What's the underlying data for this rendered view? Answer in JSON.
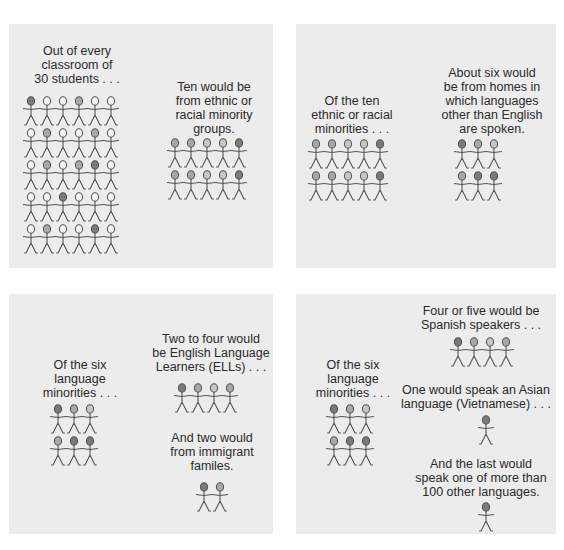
{
  "colors": {
    "panel_bg": "#ececec",
    "page_bg": "#ffffff",
    "text": "#2a2a2a",
    "head_dark": "#7a7a7a",
    "head_medium": "#a8a8a8",
    "head_light": "#c6c6c6",
    "head_white": "#f4f4f4"
  },
  "panels": [
    {
      "id": "classroom",
      "captions": [
        "Out of every\nclassroom of\n30 students . . .",
        "Ten would be\nfrom ethnic or\nracial minority\ngroups."
      ],
      "groups": [
        {
          "label": "30 students",
          "cols": 6,
          "heads": [
            "d",
            "w",
            "w",
            "m",
            "w",
            "w",
            "w",
            "m",
            "w",
            "w",
            "m",
            "w",
            "w",
            "m",
            "w",
            "m",
            "d",
            "w",
            "w",
            "w",
            "d",
            "w",
            "w",
            "w",
            "w",
            "m",
            "w",
            "w",
            "d",
            "w"
          ]
        },
        {
          "label": "10 ethnic or racial minorities",
          "cols": 5,
          "heads": [
            "m",
            "m",
            "l",
            "l",
            "d",
            "m",
            "m",
            "l",
            "l",
            "d"
          ]
        }
      ]
    },
    {
      "id": "ethnic-minorities",
      "captions": [
        "Of the ten\nethnic or racial\nminorities . . .",
        "About six would\nbe from homes in\nwhich languages\nother than English\nare spoken."
      ],
      "groups": [
        {
          "label": "10 ethnic or racial minorities",
          "cols": 5,
          "heads": [
            "m",
            "m",
            "l",
            "l",
            "d",
            "m",
            "m",
            "l",
            "l",
            "d"
          ]
        },
        {
          "label": "6 language minorities",
          "cols": 3,
          "heads": [
            "d",
            "m",
            "l",
            "m",
            "d",
            "d"
          ]
        }
      ]
    },
    {
      "id": "language-minorities-ell",
      "captions": [
        "Of the six\nlanguage\nminorities . . .",
        "Two to four would\nbe English Language\nLearners (ELLs) . . .",
        "And two would\nfrom immigrant\nfamiles."
      ],
      "groups": [
        {
          "label": "6 language minorities",
          "cols": 3,
          "heads": [
            "d",
            "m",
            "l",
            "m",
            "d",
            "d"
          ]
        },
        {
          "label": "ELLs",
          "cols": 4,
          "heads": [
            "d",
            "m",
            "l",
            "m"
          ]
        },
        {
          "label": "immigrant families",
          "cols": 2,
          "heads": [
            "d",
            "m"
          ]
        }
      ]
    },
    {
      "id": "language-minorities-languages",
      "captions": [
        "Of the six\nlanguage\nminorities . . .",
        "Four or five would be\nSpanish speakers . . .",
        "One would speak an Asian\nlanguage (Vietnamese) . . .",
        "And the last would\nspeak one of more than\n100 other languages."
      ],
      "groups": [
        {
          "label": "6 language minorities",
          "cols": 3,
          "heads": [
            "d",
            "m",
            "l",
            "m",
            "d",
            "d"
          ]
        },
        {
          "label": "Spanish speakers",
          "cols": 4,
          "heads": [
            "d",
            "m",
            "l",
            "m"
          ]
        },
        {
          "label": "Asian language speaker",
          "cols": 1,
          "heads": [
            "d"
          ]
        },
        {
          "label": "other language speaker",
          "cols": 1,
          "heads": [
            "d"
          ]
        }
      ]
    }
  ]
}
